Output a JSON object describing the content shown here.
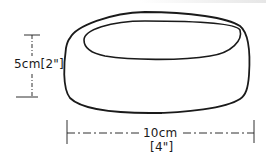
{
  "diagram": {
    "height_label": "5cm[2\"]",
    "width_label": "10cm",
    "width_label_imperial": "[4\"]",
    "line_color": "#1a1a1a"
  }
}
